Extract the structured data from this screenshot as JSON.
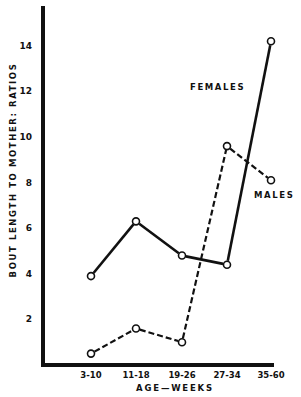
{
  "chart_data": {
    "type": "line",
    "title": "",
    "xlabel": "AGE—WEEKS",
    "ylabel": "BOUT LENGTH TO MOTHER: RATIOS",
    "categories": [
      "3-10",
      "11-18",
      "19-26",
      "27-34",
      "35-60"
    ],
    "y_ticks": [
      "2",
      "4",
      "6",
      "8",
      "10",
      "12",
      "14"
    ],
    "ylim": [
      0,
      15.5
    ],
    "grid": false,
    "legend_position": "inline labels",
    "series": [
      {
        "name": "FEMALES",
        "style": "solid",
        "values": [
          3.9,
          6.3,
          4.8,
          4.4,
          14.2
        ]
      },
      {
        "name": "MALES",
        "style": "dashed",
        "values": [
          0.5,
          1.6,
          1.0,
          9.6,
          8.1
        ]
      }
    ]
  },
  "labels": {
    "females": "FEMALES",
    "males": "MALES"
  },
  "colors": {
    "line": "#111111",
    "background": "#ffffff"
  }
}
